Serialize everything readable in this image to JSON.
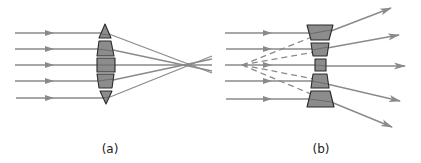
{
  "figure": {
    "colors": {
      "ray": "#8a8a8a",
      "lens_fill": "#8c8c8c",
      "lens_stroke": "#2a2a2a",
      "dashed": "#8a8a8a",
      "label": "#222222",
      "background": "#ffffff"
    }
  },
  "panels": [
    {
      "id": "a",
      "label": "(a)",
      "type": "converging-lens",
      "ray_count": 5,
      "focal_point": [
        190,
        65
      ]
    },
    {
      "id": "b",
      "label": "(b)",
      "type": "diverging-lens",
      "ray_count": 5,
      "virtual_focus": [
        242,
        65
      ],
      "dashed_extensions": true
    }
  ]
}
